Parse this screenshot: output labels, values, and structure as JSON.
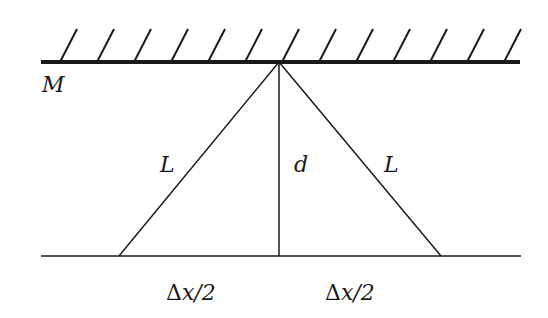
{
  "diagram": {
    "colors": {
      "stroke": "#1a1a1a",
      "background": "#ffffff"
    },
    "mirror": {
      "label": "M",
      "y": 62,
      "x1": 41,
      "x2": 520,
      "hatch_count": 13
    },
    "apex": {
      "x": 279,
      "y": 62
    },
    "ground": {
      "y": 256,
      "x1": 41,
      "x2": 521
    },
    "left_foot": {
      "x": 119
    },
    "right_foot": {
      "x": 441
    },
    "labels": {
      "mirror": "M",
      "left_side": "L",
      "right_side": "L",
      "height": "d",
      "left_half_delta": "Δ",
      "left_half_rest": "x/2",
      "right_half_delta": "Δ",
      "right_half_rest": "x/2"
    }
  }
}
